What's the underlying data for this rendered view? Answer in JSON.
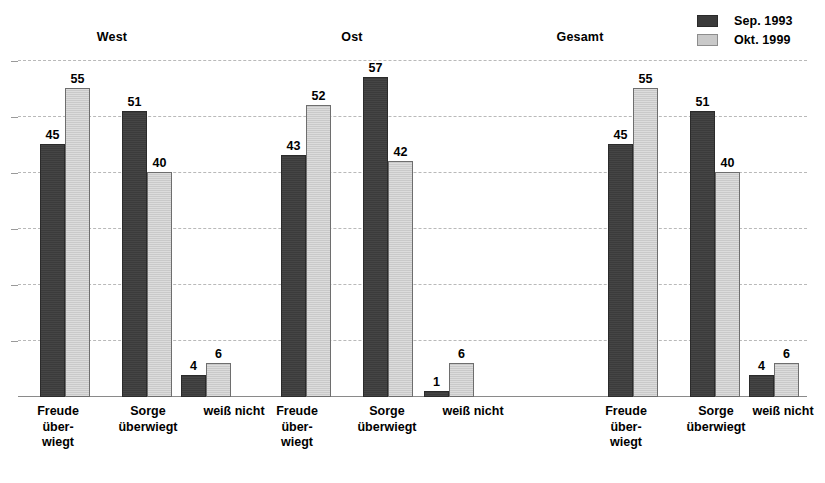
{
  "legend": {
    "position": "top-right",
    "entries": [
      {
        "label": "Sep. 1993",
        "color": "#3b3b3b",
        "swatch": "dark-swatch"
      },
      {
        "label": "Okt. 1999",
        "color": "#c9c9c9",
        "swatch": "light-swatch"
      }
    ]
  },
  "chart_data": {
    "type": "bar",
    "title": "",
    "subtitle": "",
    "xlabel": "",
    "ylabel": "",
    "ylim": [
      0,
      60
    ],
    "grid": true,
    "gridlines": [
      10,
      20,
      30,
      40,
      50,
      60
    ],
    "legend_position": "top-right",
    "groups": [
      "West",
      "Ost",
      "Gesamt"
    ],
    "categories": [
      "Freude\nüber-\nwiegt",
      "Sorge\nüberwiegt",
      "weiß nicht"
    ],
    "series": [
      {
        "name": "Sep. 1993",
        "color": "#3b3b3b",
        "values": {
          "West": [
            45,
            51,
            4
          ],
          "Ost": [
            43,
            57,
            1
          ],
          "Gesamt": [
            45,
            51,
            4
          ]
        }
      },
      {
        "name": "Okt. 1999",
        "color": "#c9c9c9",
        "values": {
          "West": [
            55,
            40,
            6
          ],
          "Ost": [
            52,
            42,
            6
          ],
          "Gesamt": [
            55,
            40,
            6
          ]
        }
      }
    ],
    "data_labels": {
      "West": {
        "Freude überwiegt": [
          45,
          55
        ],
        "Sorge überwiegt": [
          51,
          40
        ],
        "weiß nicht": [
          4,
          6
        ]
      },
      "Ost": {
        "Freude überwiegt": [
          43,
          52
        ],
        "Sorge überwiegt": [
          57,
          42
        ],
        "weiß nicht": [
          1,
          6
        ]
      },
      "Gesamt": {
        "Freude überwiegt": [
          45,
          55
        ],
        "Sorge überwiegt": [
          51,
          40
        ],
        "weiß nicht": [
          4,
          6
        ]
      }
    }
  },
  "labels": {
    "group_west": "West",
    "group_ost": "Ost",
    "group_gesamt": "Gesamt",
    "cat_freude": "Freude\nüber-\nwiegt",
    "cat_sorge": "Sorge\nüberwiegt",
    "cat_weiss": "weiß nicht"
  },
  "colors": {
    "series_1993": "#3b3b3b",
    "series_1999": "#c9c9c9",
    "gridline": "#b9b9b9",
    "axis": "#8a8a8a",
    "background": "#ffffff",
    "text": "#000000"
  }
}
